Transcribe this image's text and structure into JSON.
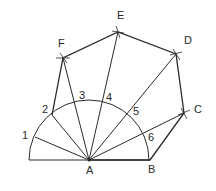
{
  "diagram": {
    "center": {
      "name": "A",
      "x": 89,
      "y": 160
    },
    "semicircle": {
      "cx": 89,
      "cy": 160,
      "r": 60
    },
    "vertices": [
      {
        "name": "A",
        "x": 89,
        "y": 160,
        "label_x": 88,
        "label_y": 176
      },
      {
        "name": "B",
        "x": 150,
        "y": 160,
        "label_x": 148,
        "label_y": 175
      },
      {
        "name": "C",
        "x": 184,
        "y": 113,
        "label_x": 194,
        "label_y": 113
      },
      {
        "name": "D",
        "x": 176,
        "y": 54,
        "label_x": 184,
        "label_y": 44
      },
      {
        "name": "E",
        "x": 118,
        "y": 32,
        "label_x": 117,
        "label_y": 19
      },
      {
        "name": "F",
        "x": 63,
        "y": 58,
        "label_x": 58,
        "label_y": 47
      }
    ],
    "division_points": [
      {
        "name": "1",
        "x": 35,
        "y": 137,
        "label_x": 22,
        "label_y": 139
      },
      {
        "name": "2",
        "x": 52,
        "y": 115,
        "label_x": 42,
        "label_y": 113
      },
      {
        "name": "3",
        "x": 76,
        "y": 102,
        "label_x": 80,
        "label_y": 99
      },
      {
        "name": "4",
        "x": 102,
        "y": 102,
        "label_x": 107,
        "label_y": 101
      },
      {
        "name": "5",
        "x": 128,
        "y": 115,
        "label_x": 134,
        "label_y": 115
      },
      {
        "name": "6",
        "x": 145,
        "y": 137,
        "label_x": 149,
        "label_y": 141
      }
    ]
  }
}
